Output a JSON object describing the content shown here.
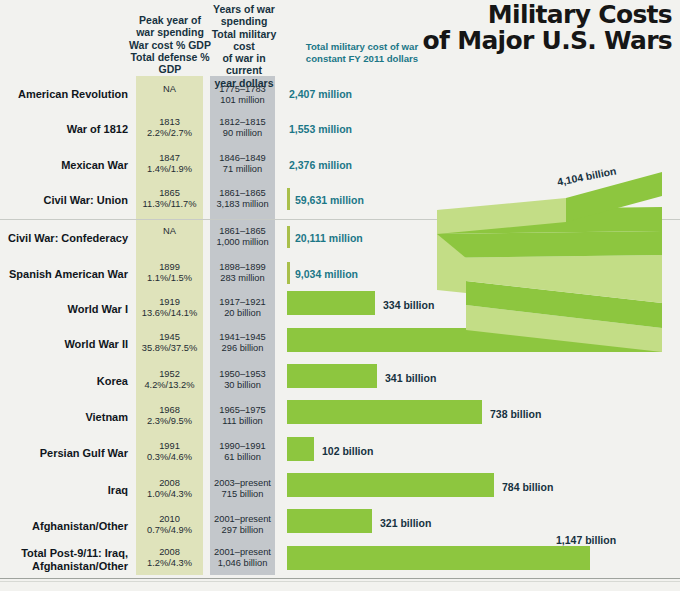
{
  "title": "Military Costs\nof Major U.S. Wars",
  "title_line1": "Military Costs",
  "title_line2": "of Major U.S. Wars",
  "headers": {
    "peak": "Peak year of\nwar spending\nWar cost % GDP\nTotal defense % GDP",
    "peak_lines": [
      "Peak year of",
      "war spending",
      "War cost % GDP",
      "Total defense % GDP"
    ],
    "years": "Years of war\nspending\nTotal military cost\nof war in current\nyear dollars",
    "years_lines": [
      "Years of war",
      "spending",
      "Total military cost",
      "of war in current",
      "year dollars"
    ],
    "total": "Total military cost of war\nconstant FY 2011 dollars",
    "total_lines": [
      "Total military cost of war",
      "constant FY 2011 dollars"
    ]
  },
  "colors": {
    "bar": "#8dc63f",
    "bar_light": "#c3dd86",
    "olive_column": "#dfe3bb",
    "gray_column": "#c3c7cb",
    "teal_text": "#1b7787",
    "label_text": "#16313f",
    "background": "#f2f2ef"
  },
  "chart_data": {
    "type": "bar",
    "title": "Military Costs of Major U.S. Wars",
    "xlabel": "Total military cost of war, constant FY 2011 dollars",
    "ylabel": "",
    "categories": [
      "American Revolution",
      "War of 1812",
      "Mexican War",
      "Civil War: Union",
      "Civil War: Confederacy",
      "Spanish American War",
      "World War I",
      "World War II",
      "Korea",
      "Vietnam",
      "Persian Gulf War",
      "Iraq",
      "Afghanistan/Other",
      "Total Post-9/11: Iraq, Afghanistan/Other"
    ],
    "values": [
      2407,
      1553,
      2376,
      59631,
      20111,
      9034,
      334000,
      4104000,
      341000,
      738000,
      102000,
      784000,
      321000,
      1147000
    ],
    "value_unit": "millions of constant FY 2011 dollars",
    "value_labels": [
      "2,407 million",
      "1,553 million",
      "2,376 million",
      "59,631 million",
      "20,111 million",
      "9,034 million",
      "334 billion",
      "4,104 billion",
      "341 billion",
      "738 billion",
      "102 billion",
      "784 billion",
      "321 billion",
      "1,147 billion"
    ]
  },
  "rows": [
    {
      "name": "American Revolution",
      "peak_year": "NA",
      "peak_pct": "",
      "years": "1775–1783",
      "current_cost": "101 million",
      "label": "2,407 million",
      "label_style": "teal"
    },
    {
      "name": "War of 1812",
      "peak_year": "1813",
      "peak_pct": "2.2%/2.7%",
      "years": "1812–1815",
      "current_cost": "90 million",
      "label": "1,553 million",
      "label_style": "teal"
    },
    {
      "name": "Mexican War",
      "peak_year": "1847",
      "peak_pct": "1.4%/1.9%",
      "years": "1846–1849",
      "current_cost": "71 million",
      "label": "2,376 million",
      "label_style": "teal"
    },
    {
      "name": "Civil War: Union",
      "peak_year": "1865",
      "peak_pct": "11.3%/11.7%",
      "years": "1861–1865",
      "current_cost": "3,183 million",
      "label": "59,631 million",
      "label_style": "teal"
    },
    {
      "name": "Civil War: Confederacy",
      "peak_year": "NA",
      "peak_pct": "",
      "years": "1861–1865",
      "current_cost": "1,000 million",
      "label": "20,111 million",
      "label_style": "teal"
    },
    {
      "name": "Spanish American War",
      "peak_year": "1899",
      "peak_pct": "1.1%/1.5%",
      "years": "1898–1899",
      "current_cost": "283 million",
      "label": "9,034 million",
      "label_style": "teal"
    },
    {
      "name": "World War I",
      "peak_year": "1919",
      "peak_pct": "13.6%/14.1%",
      "years": "1917–1921",
      "current_cost": "20 billion",
      "label": "334 billion",
      "label_style": "dark"
    },
    {
      "name": "World War II",
      "peak_year": "1945",
      "peak_pct": "35.8%/37.5%",
      "years": "1941–1945",
      "current_cost": "296 billion",
      "label": "4,104 billion",
      "label_style": "dark"
    },
    {
      "name": "Korea",
      "peak_year": "1952",
      "peak_pct": "4.2%/13.2%",
      "years": "1950–1953",
      "current_cost": "30 billion",
      "label": "341 billion",
      "label_style": "dark"
    },
    {
      "name": "Vietnam",
      "peak_year": "1968",
      "peak_pct": "2.3%/9.5%",
      "years": "1965–1975",
      "current_cost": "111 billion",
      "label": "738 billion",
      "label_style": "dark"
    },
    {
      "name": "Persian Gulf War",
      "peak_year": "1991",
      "peak_pct": "0.3%/4.6%",
      "years": "1990–1991",
      "current_cost": "61 billion",
      "label": "102 billion",
      "label_style": "dark"
    },
    {
      "name": "Iraq",
      "peak_year": "2008",
      "peak_pct": "1.0%/4.3%",
      "years": "2003–present",
      "current_cost": "715 billion",
      "label": "784 billion",
      "label_style": "dark"
    },
    {
      "name": "Afghanistan/Other",
      "peak_year": "2010",
      "peak_pct": "0.7%/4.9%",
      "years": "2001–present",
      "current_cost": "297 billion",
      "label": "321 billion",
      "label_style": "dark"
    },
    {
      "name": "Total Post-9/11: Iraq,\nAfghanistan/Other",
      "peak_year": "2008",
      "peak_pct": "1.2%/4.3%",
      "years": "2001–present",
      "current_cost": "1,046 billion",
      "label": "1,147 billion",
      "label_style": "dark"
    }
  ]
}
